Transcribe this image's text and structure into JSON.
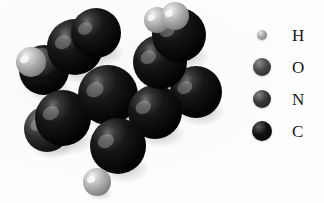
{
  "figure": {
    "kind": "space-filling-molecular-model",
    "background_color": "#fdfdfd",
    "width": 324,
    "height": 203
  },
  "legend": {
    "title": "",
    "entries": [
      {
        "label": "H",
        "element_name": "hydrogen",
        "swatch_icon": "sphere-icon",
        "radius_px": 5,
        "color": "#a9a9a9",
        "highlight_color": "#e8e8e8",
        "shadow_color": "#6e6e6e"
      },
      {
        "label": "O",
        "element_name": "oxygen",
        "swatch_icon": "sphere-icon",
        "radius_px": 9,
        "color": "#4a4a4a",
        "highlight_color": "#8f8f8f",
        "shadow_color": "#1e1e1e"
      },
      {
        "label": "N",
        "element_name": "nitrogen",
        "swatch_icon": "sphere-icon",
        "radius_px": 9,
        "color": "#3a3a3a",
        "highlight_color": "#858585",
        "shadow_color": "#141414"
      },
      {
        "label": "C",
        "element_name": "carbon",
        "swatch_icon": "sphere-icon",
        "radius_px": 10,
        "color": "#121212",
        "highlight_color": "#5a5a5a",
        "shadow_color": "#000000"
      }
    ]
  },
  "molecule": {
    "description": "Grayscale CPK space-filling model of a fused polycyclic molecule",
    "atoms": [
      {
        "id": "a1",
        "element": "C",
        "cx": 75,
        "cy": 47,
        "r": 28,
        "z": 1
      },
      {
        "id": "a2",
        "element": "C",
        "cx": 108,
        "cy": 95,
        "r": 30,
        "z": 2
      },
      {
        "id": "a3",
        "element": "C",
        "cx": 63,
        "cy": 118,
        "r": 28,
        "z": 1
      },
      {
        "id": "a4",
        "element": "C",
        "cx": 118,
        "cy": 146,
        "r": 28,
        "z": 3
      },
      {
        "id": "a5",
        "element": "C",
        "cx": 155,
        "cy": 112,
        "r": 27,
        "z": 2
      },
      {
        "id": "a6",
        "element": "C",
        "cx": 160,
        "cy": 62,
        "r": 27,
        "z": 2
      },
      {
        "id": "a7",
        "element": "C",
        "cx": 96,
        "cy": 33,
        "r": 25,
        "z": 4
      },
      {
        "id": "a8",
        "element": "C",
        "cx": 179,
        "cy": 35,
        "r": 27,
        "z": 3
      },
      {
        "id": "a9",
        "element": "C",
        "cx": 196,
        "cy": 92,
        "r": 26,
        "z": 1
      },
      {
        "id": "a10",
        "element": "C",
        "cx": 44,
        "cy": 70,
        "r": 25,
        "z": 0
      },
      {
        "id": "a11",
        "element": "N",
        "cx": 47,
        "cy": 129,
        "r": 23,
        "z": 0
      },
      {
        "id": "a12",
        "element": "O",
        "cx": 42,
        "cy": 62,
        "r": 14,
        "z": 0
      },
      {
        "id": "h1",
        "element": "H",
        "cx": 31,
        "cy": 62,
        "r": 15,
        "z": 5
      },
      {
        "id": "h2",
        "element": "H",
        "cx": 157,
        "cy": 20,
        "r": 13,
        "z": 5
      },
      {
        "id": "h3",
        "element": "H",
        "cx": 175,
        "cy": 16,
        "r": 14,
        "z": 6
      },
      {
        "id": "h4",
        "element": "H",
        "cx": 206,
        "cy": 96,
        "r": 12,
        "z": 0
      },
      {
        "id": "h5",
        "element": "H",
        "cx": 97,
        "cy": 182,
        "r": 14,
        "z": 6
      }
    ]
  }
}
